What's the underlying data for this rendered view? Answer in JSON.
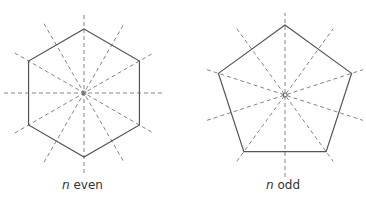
{
  "figures": [
    {
      "name": "hexagon",
      "sides": 6,
      "var": "n",
      "caption": "even",
      "axes_count": 6
    },
    {
      "name": "pentagon",
      "sides": 5,
      "var": "n",
      "caption": "odd",
      "axes_count": 5
    }
  ],
  "colors": {
    "polygon": "#555555",
    "axes": "#777777"
  }
}
